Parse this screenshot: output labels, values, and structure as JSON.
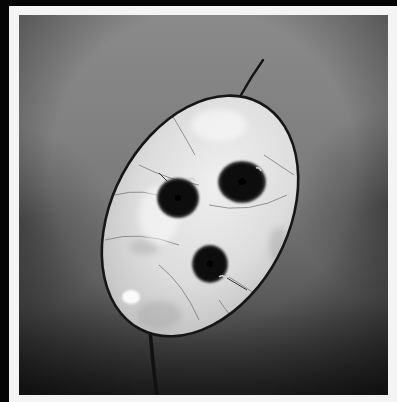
{
  "photo": {
    "alt": "Black and white photograph of a translucent honesty (Lunaria) seed pod with three dark seeds, backlit against a gray gradient background",
    "style": "monochrome",
    "background": {
      "top_color": "#8c8c8c",
      "middle_color": "#7a7a7a",
      "bottom_color": "#262626",
      "vignette_color": "#1e1e1e"
    },
    "frame": {
      "outer_color": "#050505",
      "mount_color": "#f4f4f4"
    },
    "pod": {
      "center": [
        181,
        201
      ],
      "radius_x": 88,
      "radius_y": 128,
      "rotation_deg": 28,
      "fill_color": "#d9d9d9",
      "highlight_color": "#f2f2f2",
      "edge_color": "#1a1a1a"
    },
    "seeds": [
      {
        "label": "left-seed",
        "cx": 159,
        "cy": 182,
        "r": 20
      },
      {
        "label": "upper-right-seed",
        "cx": 223,
        "cy": 167,
        "r": 23
      },
      {
        "label": "lower-seed",
        "cx": 191,
        "cy": 250,
        "r": 18
      }
    ],
    "stems": {
      "top": {
        "from": [
          224,
          78
        ],
        "to": [
          244,
          46
        ]
      },
      "bottom": {
        "from": [
          131,
          317
        ],
        "to": [
          138,
          380
        ]
      }
    },
    "highlight_spot": {
      "cx": 112,
      "cy": 282,
      "rx": 9,
      "ry": 7
    }
  }
}
